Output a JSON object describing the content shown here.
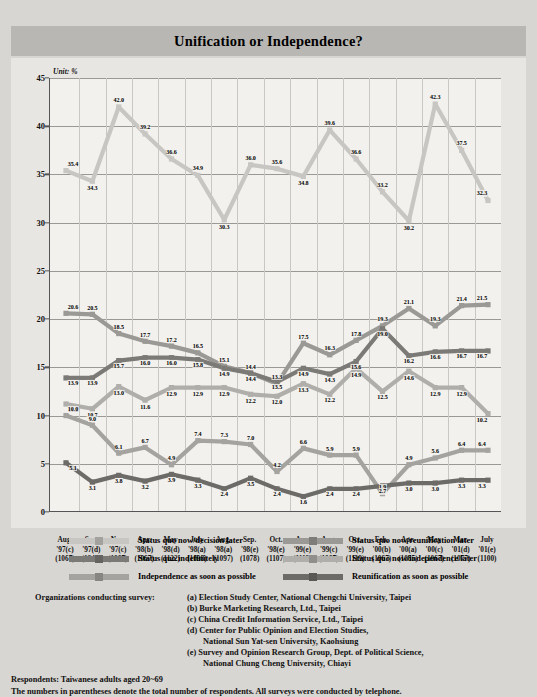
{
  "header": {
    "title": "Unification or Independence?"
  },
  "chart_data": {
    "type": "line",
    "title": "Unification or Independence?",
    "unit_label": "Unit: %",
    "xlabel": "",
    "ylabel": "",
    "ylim": [
      0,
      45
    ],
    "yticks": [
      0,
      5,
      10,
      15,
      20,
      25,
      30,
      35,
      40,
      45
    ],
    "grid": true,
    "legend_position": "below",
    "categories": [
      "Aug. '97(c)",
      "Sep. '97(d)",
      "Nov. '97(c)",
      "Apr. '98(b)",
      "May '98(d)",
      "July '98(a)",
      "Aug. '98(a)",
      "Sep. '98(e)",
      "Oct. '98(e)",
      "Apr. '99(e)",
      "Aug. '99(c)",
      "Oct. '99(e)",
      "Feb. '00(b)",
      "Apr. '00(a)",
      "May '00(c)",
      "Mar. '01(d)",
      "July '01(e)"
    ],
    "x_ticks": [
      {
        "month": "Aug.",
        "year": "'97(c)",
        "n": "(1067)"
      },
      {
        "month": "Sep.",
        "year": "'97(d)",
        "n": "(1240)"
      },
      {
        "month": "Nov.",
        "year": "'97(c)",
        "n": "(1067)"
      },
      {
        "month": "Apr.",
        "year": "'98(b)",
        "n": "(1067)"
      },
      {
        "month": "May",
        "year": "'98(d)",
        "n": "(1122)"
      },
      {
        "month": "July",
        "year": "'98(a)",
        "n": "(1098)"
      },
      {
        "month": "Aug.",
        "year": "'98(a)",
        "n": "(1097)"
      },
      {
        "month": "Sep.",
        "year": "'98(e)",
        "n": "(1078)"
      },
      {
        "month": "Oct.",
        "year": "'98(e)",
        "n": "(1107)"
      },
      {
        "month": "Apr.",
        "year": "'99(e)",
        "n": "(1112)"
      },
      {
        "month": "Aug.",
        "year": "'99(c)",
        "n": "(1067)"
      },
      {
        "month": "Oct.",
        "year": "'99(e)",
        "n": "(1119)"
      },
      {
        "month": "Feb.",
        "year": "'00(b)",
        "n": "(1067)"
      },
      {
        "month": "Apr.",
        "year": "'00(a)",
        "n": "(1085)"
      },
      {
        "month": "May",
        "year": "'00(c)",
        "n": "(1067)"
      },
      {
        "month": "Mar.",
        "year": "'01(d)",
        "n": "(1077)"
      },
      {
        "month": "July",
        "year": "'01(e)",
        "n": "(1100)"
      }
    ],
    "series": [
      {
        "name": "Status quo now/decision later",
        "color": "#c8c6c2",
        "values": [
          35.4,
          34.3,
          42.0,
          39.2,
          36.6,
          34.9,
          30.3,
          36.0,
          35.6,
          34.8,
          39.6,
          36.6,
          33.2,
          30.2,
          42.3,
          37.5,
          32.3
        ]
      },
      {
        "name": "Status quo now/reunification later",
        "color": "#9b9995",
        "values": [
          20.6,
          20.5,
          18.5,
          17.7,
          17.2,
          16.5,
          15.1,
          14.4,
          13.3,
          17.5,
          16.3,
          17.8,
          19.3,
          21.1,
          19.3,
          21.4,
          21.5
        ]
      },
      {
        "name": "Status quo indefinitely",
        "color": "#7c7a76",
        "values": [
          13.9,
          13.9,
          15.7,
          16.0,
          16.0,
          15.8,
          14.9,
          14.4,
          13.5,
          14.9,
          14.3,
          15.6,
          19.0,
          16.2,
          16.6,
          16.7,
          16.7
        ]
      },
      {
        "name": "Status quo now/independence later",
        "color": "#b0aeaa",
        "values": [
          11.2,
          10.7,
          13.0,
          11.6,
          12.9,
          12.9,
          12.9,
          12.2,
          12.0,
          13.3,
          12.2,
          14.9,
          12.5,
          14.6,
          12.9,
          12.9,
          10.2
        ]
      },
      {
        "name": "Independence as soon as possible",
        "color": "#a5a39f",
        "values": [
          10.0,
          9.0,
          6.1,
          6.7,
          4.9,
          7.4,
          7.3,
          7.0,
          4.2,
          6.6,
          5.9,
          5.9,
          1.9,
          4.9,
          5.6,
          6.4,
          6.4
        ]
      },
      {
        "name": "Reunification as soon as possible",
        "color": "#6d6b67",
        "values": [
          5.1,
          3.1,
          3.8,
          3.2,
          3.9,
          3.3,
          2.4,
          3.5,
          2.4,
          1.6,
          2.4,
          2.4,
          2.7,
          3.0,
          3.0,
          3.3,
          3.3
        ]
      }
    ]
  },
  "legend": {
    "items": [
      {
        "label": "Status quo now/decision later",
        "color": "#c8c6c2"
      },
      {
        "label": "Status quo now/reunification later",
        "color": "#9b9995"
      },
      {
        "label": "Status quo indefinitely",
        "color": "#7c7a76"
      },
      {
        "label": "Status quo now/independence later",
        "color": "#b0aeaa"
      },
      {
        "label": "Independence as soon as possible",
        "color": "#a5a39f"
      },
      {
        "label": "Reunification as soon as possible",
        "color": "#6d6b67"
      }
    ]
  },
  "footer": {
    "organizations_heading": "Organizations conducting survey:",
    "organizations": [
      {
        "text": "(a) Election Study Center, National Chengchi University, Taipei",
        "indent": false
      },
      {
        "text": "(b) Burke Marketing Research, Ltd., Taipei",
        "indent": false
      },
      {
        "text": "(c) China Credit Information Service, Ltd., Taipei",
        "indent": false
      },
      {
        "text": "(d) Center for Public Opinion and Election Studies,",
        "indent": false
      },
      {
        "text": "National Sun Yat-sen University, Kaohsiung",
        "indent": true
      },
      {
        "text": "(e) Survey and Opinion Research Group, Dept. of Political Science,",
        "indent": false
      },
      {
        "text": "National Chung Cheng University, Chiayi",
        "indent": true
      }
    ],
    "respondents": "Respondents: Taiwanese adults aged 20~69",
    "note": "The numbers in parentheses denote the total number of respondents. All surveys were conducted by telephone."
  }
}
